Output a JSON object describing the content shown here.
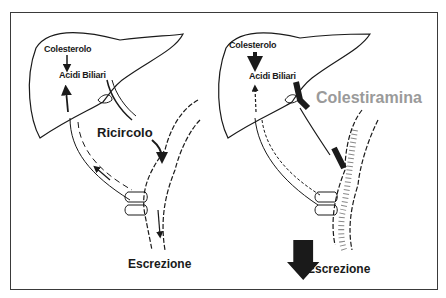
{
  "panels": [
    {
      "id": "left",
      "cholesterol_label": "Colesterolo",
      "bile_acids_label": "Acidi Biliari",
      "process_label": "Ricircolo",
      "excretion_label": "Escrezione"
    },
    {
      "id": "right",
      "cholesterol_label": "Colesterolo",
      "bile_acids_label": "Acidi Biliari",
      "drug_label": "Colestiramina",
      "excretion_label": "Escrezione"
    }
  ],
  "colors": {
    "ink": "#1a1a1a",
    "drug_label": "#9a9a9a",
    "frame": "#3a3a3a"
  }
}
